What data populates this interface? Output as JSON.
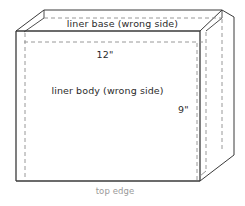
{
  "diagram": {
    "labels": {
      "liner_base": "liner base (wrong side)",
      "liner_body": "liner body (wrong side)",
      "width": "12\"",
      "height": "9\"",
      "top_edge": "top edge"
    },
    "colors": {
      "solid_line": "#3a3a3a",
      "dashed_line": "#8c8c8c",
      "label_text": "#2b2b2b",
      "muted_text": "#9a9a9a",
      "background": "#ffffff"
    },
    "dimensions": {
      "width_inches": 12,
      "height_inches": 9,
      "width_unit": "inch",
      "height_unit": "inch"
    },
    "geometry": {
      "front_face": {
        "left": 16,
        "top": 31,
        "right": 200,
        "bottom": 181
      },
      "base_flap_top": 10,
      "right_flap_right": 234
    }
  }
}
